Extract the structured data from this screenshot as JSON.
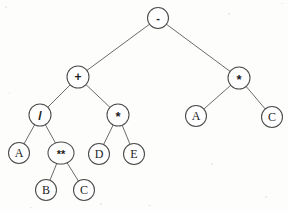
{
  "diagram": {
    "type": "binary-expression-tree",
    "background_color": "#fdfdfc",
    "node_fill_color": "#fefefe",
    "node_stroke_color": "#4a4a4a",
    "edge_color": "#5a5a5a",
    "label_color": "#1c1c1c",
    "width": 288,
    "height": 211,
    "nodes": [
      {
        "id": "n0",
        "label": "-",
        "kind": "operator",
        "x": 158,
        "y": 18,
        "rx": 10.5,
        "ry": 10.5,
        "font_size": 11
      },
      {
        "id": "n1",
        "label": "+",
        "kind": "operator",
        "x": 78,
        "y": 77,
        "rx": 11,
        "ry": 11,
        "font_size": 12
      },
      {
        "id": "n2",
        "label": "*",
        "kind": "operator",
        "x": 239,
        "y": 78,
        "rx": 11,
        "ry": 11,
        "font_size": 13
      },
      {
        "id": "n3",
        "label": "/",
        "kind": "operator",
        "x": 40,
        "y": 115,
        "rx": 11,
        "ry": 11,
        "font_size": 13
      },
      {
        "id": "n4",
        "label": "*",
        "kind": "operator",
        "x": 118,
        "y": 115,
        "rx": 11,
        "ry": 11,
        "font_size": 13
      },
      {
        "id": "n5",
        "label": "A",
        "kind": "operand",
        "x": 196,
        "y": 116,
        "rx": 10.5,
        "ry": 10.5,
        "font_size": 12
      },
      {
        "id": "n6",
        "label": "C",
        "kind": "operand",
        "x": 272,
        "y": 117,
        "rx": 10.5,
        "ry": 10.5,
        "font_size": 12
      },
      {
        "id": "n7",
        "label": "A",
        "kind": "operand",
        "x": 19,
        "y": 153,
        "rx": 10.5,
        "ry": 10.5,
        "font_size": 12
      },
      {
        "id": "n8",
        "label": "**",
        "kind": "operator",
        "x": 61,
        "y": 153,
        "rx": 13,
        "ry": 11,
        "font_size": 11
      },
      {
        "id": "n9",
        "label": "D",
        "kind": "operand",
        "x": 99,
        "y": 154,
        "rx": 10.5,
        "ry": 10.5,
        "font_size": 12
      },
      {
        "id": "n10",
        "label": "E",
        "kind": "operand",
        "x": 134,
        "y": 154,
        "rx": 10.5,
        "ry": 10.5,
        "font_size": 12
      },
      {
        "id": "n11",
        "label": "B",
        "kind": "operand",
        "x": 46,
        "y": 190,
        "rx": 10.5,
        "ry": 10.5,
        "font_size": 12
      },
      {
        "id": "n12",
        "label": "C",
        "kind": "operand",
        "x": 84,
        "y": 190,
        "rx": 10.5,
        "ry": 10.5,
        "font_size": 12
      }
    ],
    "edges": [
      {
        "from": "n0",
        "to": "n1",
        "name": "edge-minus-to-plus"
      },
      {
        "from": "n0",
        "to": "n2",
        "name": "edge-minus-to-times-right"
      },
      {
        "from": "n1",
        "to": "n3",
        "name": "edge-plus-to-divide"
      },
      {
        "from": "n1",
        "to": "n4",
        "name": "edge-plus-to-times-mid"
      },
      {
        "from": "n2",
        "to": "n5",
        "name": "edge-times-right-to-a"
      },
      {
        "from": "n2",
        "to": "n6",
        "name": "edge-times-right-to-c"
      },
      {
        "from": "n3",
        "to": "n7",
        "name": "edge-divide-to-a"
      },
      {
        "from": "n3",
        "to": "n8",
        "name": "edge-divide-to-power"
      },
      {
        "from": "n4",
        "to": "n9",
        "name": "edge-times-mid-to-d"
      },
      {
        "from": "n4",
        "to": "n10",
        "name": "edge-times-mid-to-e"
      },
      {
        "from": "n8",
        "to": "n11",
        "name": "edge-power-to-b"
      },
      {
        "from": "n8",
        "to": "n12",
        "name": "edge-power-to-c"
      }
    ],
    "specks": [
      {
        "x": 5,
        "y": 6,
        "w": 2,
        "h": 2
      },
      {
        "x": 281,
        "y": 3,
        "w": 2,
        "h": 1
      },
      {
        "x": 228,
        "y": 13,
        "w": 2,
        "h": 2
      },
      {
        "x": 9,
        "y": 92,
        "w": 1,
        "h": 2
      },
      {
        "x": 211,
        "y": 163,
        "w": 2,
        "h": 2
      },
      {
        "x": 265,
        "y": 196,
        "w": 2,
        "h": 2
      },
      {
        "x": 148,
        "y": 205,
        "w": 3,
        "h": 1
      },
      {
        "x": 30,
        "y": 207,
        "w": 2,
        "h": 1
      },
      {
        "x": 190,
        "y": 44,
        "w": 1,
        "h": 1
      },
      {
        "x": 100,
        "y": 203,
        "w": 2,
        "h": 2
      }
    ]
  }
}
